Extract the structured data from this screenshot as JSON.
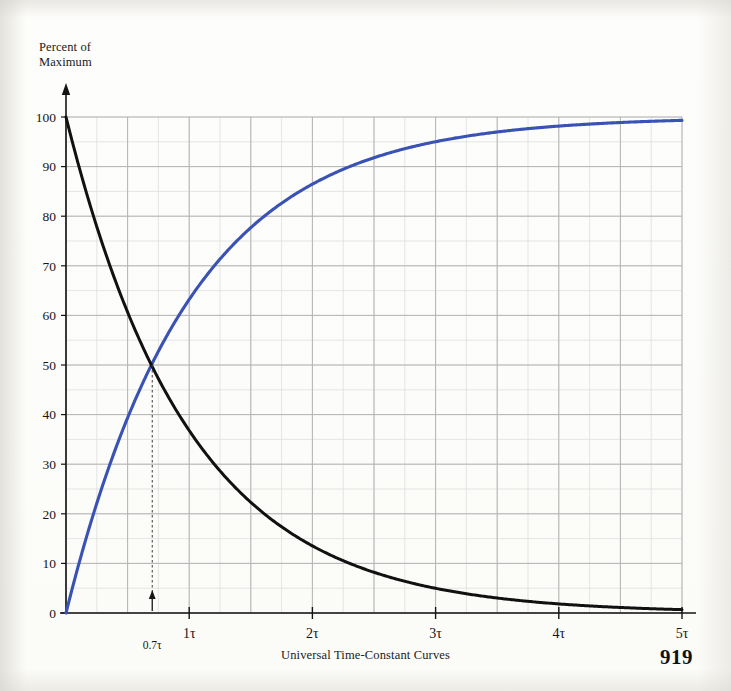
{
  "figure": {
    "caption": "Universal Time-Constant Curves",
    "page_number": "919",
    "y_axis_title": "Percent of\nMaximum"
  },
  "chart_data": {
    "type": "line",
    "title": "Universal Time-Constant Curves",
    "xlabel": "",
    "ylabel": "Percent of Maximum",
    "xlim": [
      0,
      5
    ],
    "ylim": [
      0,
      100
    ],
    "x_tick_labels": [
      "1τ",
      "2τ",
      "3τ",
      "4τ",
      "5τ"
    ],
    "x_tick_values": [
      1,
      2,
      3,
      4,
      5
    ],
    "y_tick_labels": [
      "0",
      "10",
      "20",
      "30",
      "40",
      "50",
      "60",
      "70",
      "80",
      "90",
      "100"
    ],
    "y_tick_values": [
      0,
      10,
      20,
      30,
      40,
      50,
      60,
      70,
      80,
      90,
      100
    ],
    "grid": true,
    "grid_major_step_x": 0.5,
    "grid_minor_step_x": 0.25,
    "grid_major_step_y": 10,
    "grid_minor_step_y": 5,
    "legend": "none",
    "annotations": [
      {
        "label": "0.7τ",
        "x": 0.7,
        "y": 50,
        "style": "dashed-drop-line-with-arrow",
        "note": "curves cross at approximately 50 percent"
      }
    ],
    "series": [
      {
        "name": "rising",
        "formula": "100 * (1 - exp(-t/tau))",
        "color": "#3a52b4",
        "x": [
          0,
          0.1,
          0.2,
          0.3,
          0.4,
          0.5,
          0.6,
          0.7,
          0.8,
          0.9,
          1.0,
          1.2,
          1.4,
          1.6,
          1.8,
          2.0,
          2.2,
          2.4,
          2.6,
          2.8,
          3.0,
          3.2,
          3.4,
          3.6,
          3.8,
          4.0,
          4.2,
          4.4,
          4.6,
          4.8,
          5.0
        ],
        "values": [
          0,
          9.5,
          18.1,
          25.9,
          33.0,
          39.3,
          45.1,
          50.3,
          55.1,
          59.3,
          63.2,
          69.9,
          75.3,
          79.8,
          83.5,
          86.5,
          88.9,
          90.9,
          92.6,
          93.9,
          95.0,
          95.9,
          96.7,
          97.3,
          97.8,
          98.2,
          98.5,
          98.8,
          99.0,
          99.2,
          99.3
        ]
      },
      {
        "name": "decaying",
        "formula": "100 * exp(-t/tau)",
        "color": "#111111",
        "x": [
          0,
          0.1,
          0.2,
          0.3,
          0.4,
          0.5,
          0.6,
          0.7,
          0.8,
          0.9,
          1.0,
          1.2,
          1.4,
          1.6,
          1.8,
          2.0,
          2.2,
          2.4,
          2.6,
          2.8,
          3.0,
          3.2,
          3.4,
          3.6,
          3.8,
          4.0,
          4.2,
          4.4,
          4.6,
          4.8,
          5.0
        ],
        "values": [
          100,
          90.5,
          81.9,
          74.1,
          67.0,
          60.7,
          54.9,
          49.7,
          44.9,
          40.7,
          36.8,
          30.1,
          24.7,
          20.2,
          16.5,
          13.5,
          11.1,
          9.1,
          7.4,
          6.1,
          5.0,
          4.1,
          3.3,
          2.7,
          2.2,
          1.8,
          1.5,
          1.2,
          1.0,
          0.8,
          0.7
        ]
      }
    ]
  },
  "colors": {
    "rising_curve": "#3a52b4",
    "decaying_curve": "#111111",
    "grid_major": "#b4b4b4",
    "grid_minor": "#dedede",
    "axis": "#141414",
    "annotation": "#3a3a3a"
  }
}
